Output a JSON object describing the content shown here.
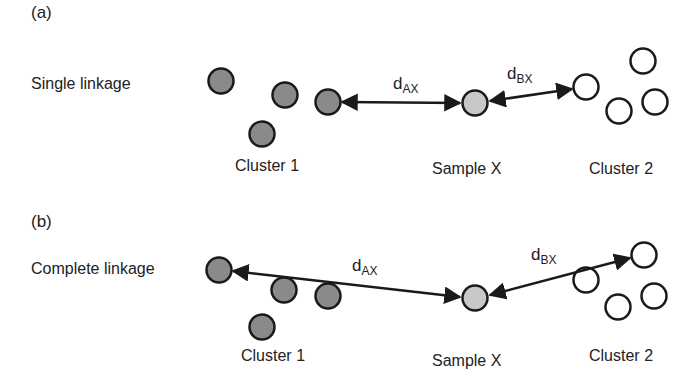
{
  "panels": [
    {
      "id": "a",
      "panel_label": "(a)",
      "method_label": "Single linkage",
      "cluster1_label": "Cluster 1",
      "sample_label": "Sample X",
      "cluster2_label": "Cluster 2",
      "dax": {
        "d": "d",
        "sub": "AX"
      },
      "dbx": {
        "d": "d",
        "sub": "BX"
      }
    },
    {
      "id": "b",
      "panel_label": "(b)",
      "method_label": "Complete linkage",
      "cluster1_label": "Cluster 1",
      "sample_label": "Sample X",
      "cluster2_label": "Cluster 2",
      "dax": {
        "d": "d",
        "sub": "AX"
      },
      "dbx": {
        "d": "d",
        "sub": "BX"
      }
    }
  ],
  "colors": {
    "cluster1_fill": "#8a8a8a",
    "sample_fill": "#c8c8c8",
    "cluster2_fill": "#ffffff",
    "stroke": "#1a1a1a"
  }
}
